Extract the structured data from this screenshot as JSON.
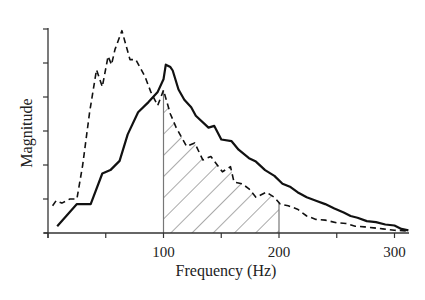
{
  "chart_data": {
    "type": "line",
    "title": "",
    "xlabel": "Frequency (Hz)",
    "ylabel": "Magnitude",
    "xlim": [
      0,
      312
    ],
    "ylim": [
      0,
      6
    ],
    "x_ticks": [
      0,
      50,
      100,
      150,
      200,
      250,
      300
    ],
    "x_tick_labels": [
      "",
      "",
      "100",
      "",
      "200",
      "",
      "300"
    ],
    "y_ticks": [
      0,
      1,
      2,
      3,
      4,
      5,
      6
    ],
    "y_tick_labels": [
      "",
      "",
      "",
      "",
      "",
      "",
      ""
    ],
    "grid": false,
    "legend": null,
    "series": [
      {
        "name": "solid",
        "style": "solid",
        "color": "#111111",
        "width": 2.2,
        "x": [
          8,
          25,
          37,
          47,
          54,
          62,
          69,
          78,
          87,
          95,
          100,
          102,
          106,
          108,
          113,
          118,
          124,
          128,
          139,
          144,
          150,
          159,
          165,
          174,
          180,
          188,
          196,
          203,
          210,
          216,
          224,
          232,
          240,
          248,
          256,
          262,
          268,
          276,
          284,
          292,
          300,
          306,
          312
        ],
        "y": [
          0.2,
          0.85,
          0.85,
          1.75,
          1.85,
          2.12,
          2.9,
          3.55,
          3.85,
          4.15,
          4.52,
          4.95,
          4.88,
          4.78,
          4.22,
          3.92,
          3.7,
          3.45,
          3.1,
          3.15,
          2.75,
          2.7,
          2.45,
          2.2,
          2.1,
          1.85,
          1.68,
          1.45,
          1.35,
          1.2,
          1.05,
          0.95,
          0.85,
          0.72,
          0.6,
          0.5,
          0.45,
          0.35,
          0.32,
          0.25,
          0.22,
          0.12,
          0.08
        ]
      },
      {
        "name": "dashed",
        "style": "dashed",
        "color": "#111111",
        "width": 1.6,
        "x": [
          4,
          7,
          12,
          19,
          25,
          30,
          36,
          42,
          47,
          52,
          55,
          58,
          64,
          71,
          76,
          84,
          89,
          95,
          100,
          106,
          111,
          120,
          127,
          134,
          141,
          151,
          158,
          161,
          168,
          174,
          180,
          189,
          196,
          201,
          208,
          216,
          224,
          232,
          240,
          250,
          258,
          266,
          274,
          282,
          290,
          300,
          312
        ],
        "y": [
          0.8,
          0.95,
          0.88,
          1.0,
          1.0,
          2.0,
          3.55,
          4.8,
          4.3,
          5.2,
          4.95,
          5.4,
          5.95,
          5.1,
          5.1,
          4.6,
          4.15,
          3.75,
          4.2,
          3.5,
          3.1,
          2.55,
          2.65,
          2.15,
          2.25,
          1.8,
          1.95,
          1.5,
          1.45,
          1.3,
          1.05,
          1.2,
          1.05,
          0.85,
          0.8,
          0.7,
          0.5,
          0.4,
          0.38,
          0.3,
          0.28,
          0.2,
          0.18,
          0.15,
          0.12,
          0.08,
          0.06
        ]
      }
    ],
    "annotations": [
      {
        "type": "hatched_region",
        "x_start": 100,
        "x_end": 200,
        "upper_bound": "dashed",
        "hatch": "diagonal",
        "edge_color": "#777777"
      }
    ]
  }
}
